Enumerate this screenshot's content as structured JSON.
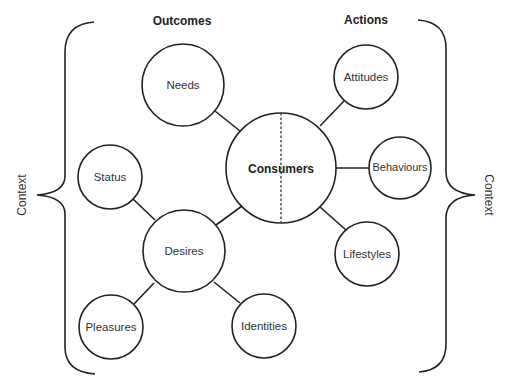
{
  "headers": {
    "outcomes": "Outcomes",
    "actions": "Actions"
  },
  "context": {
    "left": "Context",
    "right": "Context"
  },
  "nodes": {
    "consumers": "Consumers",
    "needs": "Needs",
    "desires": "Desires",
    "status": "Status",
    "pleasures": "Pleasures",
    "identities": "Identities",
    "attitudes": "Attitudes",
    "behaviours": "Behaviours",
    "lifestyles": "Lifestyles"
  },
  "colors": {
    "stroke": "#222222",
    "text": "#333333",
    "background": "#ffffff"
  }
}
